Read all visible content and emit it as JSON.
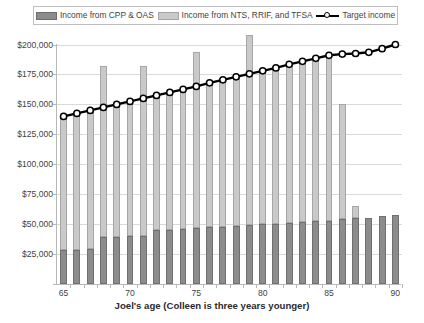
{
  "legend": {
    "items": [
      {
        "label": "Income from CPP & OAS",
        "icon": "dark-gray-swatch",
        "color": "#8c8c8c"
      },
      {
        "label": "Income from NTS, RRIF, and TFSA",
        "icon": "light-gray-swatch",
        "color": "#c9c9c9"
      },
      {
        "label": "Target income",
        "icon": "black-line-marker",
        "color": "#000000"
      }
    ]
  },
  "chart_data": {
    "type": "bar",
    "title": "",
    "xlabel": "Joel's age (Colleen is three years younger)",
    "ylabel": "",
    "ylim": [
      0,
      200000
    ],
    "ytick_values": [
      0,
      25000,
      50000,
      75000,
      100000,
      125000,
      150000,
      175000,
      200000
    ],
    "ytick_labels": [
      "$0",
      "$25,000",
      "$50,000",
      "$75,000",
      "$100,000",
      "$125,000",
      "$150,000",
      "$175,000",
      "$200,000"
    ],
    "ytick_labels_shown": [
      "$25,000",
      "$50,000",
      "$75,000",
      "$100,000",
      "$125,000",
      "$150,000",
      "$175,000",
      "$200,000"
    ],
    "categories": [
      65,
      66,
      67,
      68,
      69,
      70,
      71,
      72,
      73,
      74,
      75,
      76,
      77,
      78,
      79,
      80,
      81,
      82,
      83,
      84,
      85,
      86,
      87,
      88,
      89,
      90
    ],
    "xtick_labels": [
      "65",
      "70",
      "75",
      "80",
      "85",
      "90"
    ],
    "xtick_values": [
      65,
      70,
      75,
      80,
      85,
      90
    ],
    "grid": true,
    "stacked": true,
    "legend_position": "top",
    "series": [
      {
        "name": "Income from CPP & OAS",
        "color": "#8c8c8c",
        "values": [
          28000,
          28500,
          29000,
          39000,
          39500,
          40000,
          40500,
          45000,
          45500,
          46000,
          47000,
          47500,
          48000,
          48500,
          49000,
          50000,
          50500,
          51000,
          52000,
          52500,
          53000,
          54000,
          55000,
          55500,
          56500,
          57500
        ]
      },
      {
        "name": "Income from NTS, RRIF, and TFSA",
        "color": "#c9c9c9",
        "values": [
          112000,
          114000,
          115500,
          143000,
          108500,
          110500,
          141500,
          112000,
          114000,
          116000,
          147000,
          120500,
          122000,
          124500,
          159000,
          128000,
          130000,
          132500,
          134500,
          136500,
          138000,
          96500,
          10000,
          0,
          0,
          0
        ]
      }
    ],
    "bar_totals": [
      140000,
      142500,
      144500,
      182000,
      148000,
      150500,
      182000,
      157000,
      159500,
      162000,
      194000,
      168000,
      170000,
      173000,
      208000,
      178000,
      180500,
      183500,
      186500,
      189000,
      191000,
      150500,
      65000,
      55500,
      56500,
      57500
    ],
    "target_line": {
      "name": "Target income",
      "color": "#000000",
      "marker": "circle-white-fill",
      "x": [
        65,
        66,
        67,
        68,
        69,
        70,
        71,
        72,
        73,
        74,
        75,
        76,
        77,
        78,
        79,
        80,
        81,
        82,
        83,
        84,
        85,
        86,
        87,
        88,
        89,
        90
      ],
      "values": [
        140000,
        142500,
        145000,
        147500,
        150000,
        152500,
        155000,
        157500,
        160000,
        162500,
        165000,
        168000,
        170500,
        173000,
        175500,
        178000,
        180500,
        183500,
        186000,
        188500,
        191000,
        192000,
        192500,
        193500,
        196500,
        200000
      ]
    }
  }
}
